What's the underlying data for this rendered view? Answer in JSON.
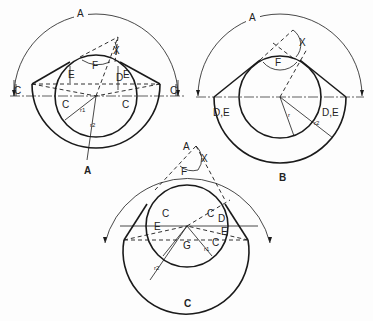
{
  "figure": {
    "type": "technical drawing - three panels of a circle with tangent V-shape and dimension arcs",
    "colors": {
      "ink": "#1a1a1a",
      "background": "#fdfdfd"
    },
    "panels": [
      {
        "id": "A",
        "caption": "A",
        "labels": {
          "arc": "A",
          "x": "X",
          "f": "F",
          "e_left": "E",
          "e_right": "E",
          "d": "D",
          "c_outer_left": "C",
          "c_outer_right": "C",
          "c_inner_left": "C",
          "c_inner_right": "C",
          "r1": "r1",
          "r2": "r2"
        }
      },
      {
        "id": "B",
        "caption": "B",
        "labels": {
          "arc": "A",
          "x": "X",
          "f": "F",
          "de_left": "D,E",
          "de_right": "D,E",
          "r": "r",
          "r2": "r2"
        }
      },
      {
        "id": "C",
        "caption": "C",
        "labels": {
          "arc": "A",
          "x": "X",
          "f": "F",
          "c_left": "C",
          "c_right": "C",
          "e_left": "E",
          "e_right": "E",
          "d": "D",
          "c_small": "C",
          "g": "G",
          "r1": "r1",
          "r2": "r2"
        }
      }
    ]
  }
}
